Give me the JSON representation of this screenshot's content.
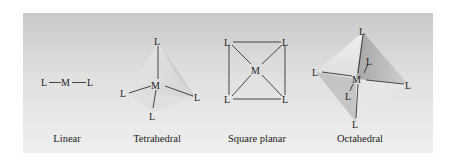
{
  "figure": {
    "background": {
      "top": "#c9c9c9",
      "bottom": "#efefef"
    },
    "geometries": [
      {
        "name": "Linear",
        "metal": "M",
        "ligand": "L",
        "coordination": 2
      },
      {
        "name": "Tetrahedral",
        "metal": "M",
        "ligand": "L",
        "coordination": 4
      },
      {
        "name": "Square planar",
        "metal": "M",
        "ligand": "L",
        "coordination": 4
      },
      {
        "name": "Octahedral",
        "metal": "M",
        "ligand": "L",
        "coordination": 6
      }
    ]
  }
}
